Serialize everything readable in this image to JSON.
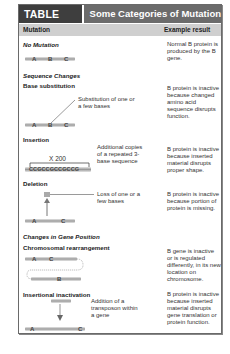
{
  "header": {
    "table_number": "TABLE 11.1",
    "title": "Some Categories of Mutation"
  },
  "columns": {
    "mutation": "Mutation",
    "example_result": "Example result"
  },
  "sections": [
    {
      "title": "No Mutation",
      "rows": [
        {
          "label": "",
          "genes": [
            "A",
            "B",
            "C"
          ],
          "annotation": "",
          "result": "Normal B protein is produced by the B gene."
        }
      ]
    },
    {
      "title": "Sequence Changes",
      "rows": [
        {
          "label": "Base substitution",
          "genes": [
            "A",
            "B",
            "C"
          ],
          "annotation": "Substitution of one or a few bases",
          "result": "B protein is inactive because changed amino acid sequence disrupts function."
        },
        {
          "label": "Insertion",
          "repeat_label": "X 200",
          "sequence": "CCGCCGCCGCCG",
          "annotation": "Additional copies of a repeated 3-base sequence",
          "result": "B protein is inactive because inserted material disrupts proper shape."
        },
        {
          "label": "Deletion",
          "genes": [
            "A",
            "C"
          ],
          "annotation": "Loss of one or a few bases",
          "result": "B protein is inactive because portion of protein is missing."
        }
      ]
    },
    {
      "title": "Changes in Gene Position",
      "rows": [
        {
          "label": "Chromosomal rearrangement",
          "genes": [
            "A",
            "C",
            "B"
          ],
          "annotation": "",
          "result": "B gene is inactive or is regulated differently, in its new location on chromosome."
        },
        {
          "label": "Insertional inactivation",
          "genes": [
            "A",
            "C"
          ],
          "annotation": "Addition of a transposon within a gene",
          "result": "B protein is inactive because inserted material disrupts gene translation or protein function."
        }
      ]
    }
  ],
  "colors": {
    "header_dark": "#3e3e3e",
    "header_mid": "#6b6b6b",
    "column_header": "#cfcfcf"
  }
}
